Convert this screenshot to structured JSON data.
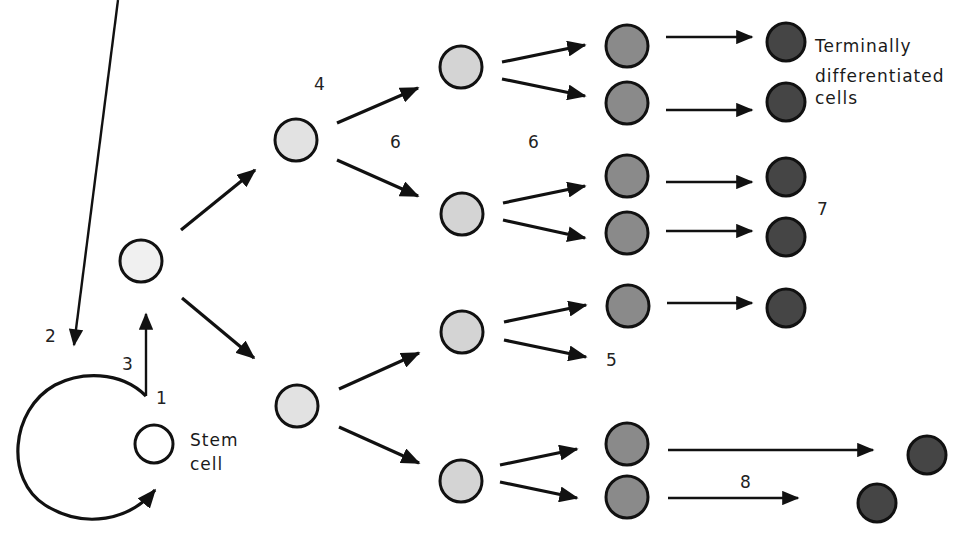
{
  "diagram": {
    "colors": {
      "background": "#ffffff",
      "stroke": "#111111",
      "stem_fill": "#ffffff",
      "progenitor_fill": "#ececec",
      "intermediate_fill": "#d6d6d6",
      "committed_fill": "#8a8a8a",
      "terminal_fill": "#4a4a4a"
    },
    "labels": {
      "stem_cell_line1": "Stem",
      "stem_cell_line2": "cell",
      "terminal_line1": "Terminally",
      "terminal_line2": "differentiated",
      "terminal_line3": "cells",
      "n1": "1",
      "n2": "2",
      "n3": "3",
      "n4": "4",
      "n5": "5",
      "n6a": "6",
      "n6b": "6",
      "n7": "7",
      "n8": "8"
    },
    "stages": [
      {
        "name": "stem cell",
        "count": 1
      },
      {
        "name": "progenitor",
        "count": 1
      },
      {
        "name": "transit amplifying",
        "count": 2
      },
      {
        "name": "intermediate",
        "count": 4
      },
      {
        "name": "committed",
        "count": 7
      },
      {
        "name": "terminally differentiated",
        "count": 7
      }
    ]
  }
}
